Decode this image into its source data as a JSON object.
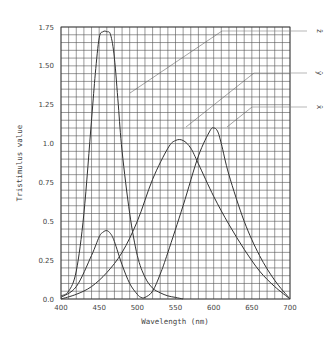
{
  "chart_data": {
    "type": "line",
    "title": "",
    "xlabel": "Wavelength (nm)",
    "ylabel": "Tristimulus value",
    "xlim": [
      400,
      700
    ],
    "ylim": [
      0,
      1.75
    ],
    "grid": true,
    "x_ticks": [
      "400",
      "450",
      "500",
      "550",
      "600",
      "650",
      "700"
    ],
    "y_ticks": [
      "0.0",
      "0.25",
      "0.5",
      "0.75",
      "1.0",
      "1.25",
      "1.50",
      "1.75"
    ],
    "legend_position": "right, leader lines",
    "series": [
      {
        "name": "z̄",
        "x": [
          400,
          410,
          420,
          430,
          440,
          445,
          450,
          455,
          460,
          465,
          470,
          475,
          480,
          490,
          500,
          510,
          520,
          530,
          540,
          550,
          560
        ],
        "values": [
          0.02,
          0.05,
          0.18,
          0.55,
          1.15,
          1.45,
          1.68,
          1.72,
          1.72,
          1.7,
          1.55,
          1.25,
          0.95,
          0.55,
          0.28,
          0.14,
          0.07,
          0.04,
          0.02,
          0.01,
          0.0
        ]
      },
      {
        "name": "ȳ",
        "x": [
          400,
          420,
          440,
          460,
          480,
          500,
          520,
          540,
          550,
          560,
          570,
          580,
          600,
          620,
          640,
          660,
          680,
          700
        ],
        "values": [
          0.0,
          0.03,
          0.08,
          0.17,
          0.3,
          0.5,
          0.77,
          0.97,
          1.02,
          1.02,
          0.97,
          0.87,
          0.66,
          0.48,
          0.32,
          0.18,
          0.08,
          0.0
        ]
      },
      {
        "name": "x̄",
        "x": [
          400,
          420,
          440,
          450,
          455,
          460,
          465,
          470,
          480,
          490,
          500,
          505,
          510,
          520,
          530,
          540,
          560,
          580,
          595,
          600,
          605,
          610,
          620,
          640,
          660,
          680,
          700
        ],
        "values": [
          0.01,
          0.08,
          0.28,
          0.4,
          0.43,
          0.44,
          0.42,
          0.37,
          0.22,
          0.1,
          0.03,
          0.01,
          0.01,
          0.05,
          0.16,
          0.3,
          0.6,
          0.92,
          1.08,
          1.1,
          1.08,
          1.0,
          0.8,
          0.5,
          0.28,
          0.12,
          0.0
        ]
      }
    ]
  },
  "legend": {
    "z_label": "z̄",
    "y_label": "ȳ",
    "x_label": "x̄"
  }
}
